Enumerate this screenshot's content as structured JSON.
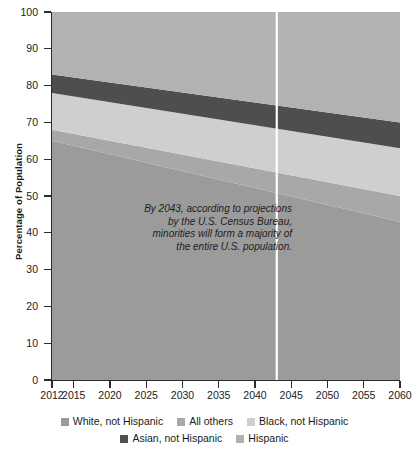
{
  "chart_data": {
    "type": "area",
    "title": "",
    "subtitle": "",
    "xlabel": "",
    "ylabel": "Percentage of Population",
    "xlim": [
      2012,
      2060
    ],
    "ylim": [
      0,
      100
    ],
    "grid": false,
    "stacked": true,
    "legend_position": "bottom",
    "x": [
      2012,
      2060
    ],
    "xticks": [
      "2012",
      "2015",
      "2020",
      "2025",
      "2030",
      "2035",
      "2040",
      "2045",
      "2050",
      "2055",
      "2060"
    ],
    "xtick_values": [
      2012,
      2015,
      2020,
      2025,
      2030,
      2035,
      2040,
      2045,
      2050,
      2055,
      2060
    ],
    "yticks": [
      "0",
      "10",
      "20",
      "30",
      "40",
      "50",
      "60",
      "70",
      "80",
      "90",
      "100"
    ],
    "ytick_values": [
      0,
      10,
      20,
      30,
      40,
      50,
      60,
      70,
      80,
      90,
      100
    ],
    "series": [
      {
        "name": "White, not Hispanic",
        "color": "#9b9b9b",
        "values": [
          65,
          43
        ],
        "cumulative_top": [
          65,
          43
        ]
      },
      {
        "name": "All others",
        "color": "#a8a8a8",
        "values": [
          3,
          7
        ],
        "cumulative_top": [
          68,
          50
        ]
      },
      {
        "name": "Black, not Hispanic",
        "color": "#cfcfcf",
        "values": [
          10,
          13
        ],
        "cumulative_top": [
          78,
          63
        ]
      },
      {
        "name": "Asian, not Hispanic",
        "color": "#4e4e4e",
        "values": [
          5,
          7
        ],
        "cumulative_top": [
          83,
          70
        ]
      },
      {
        "name": "Hispanic",
        "color": "#b2b2b2",
        "values": [
          17,
          30
        ],
        "cumulative_top": [
          100,
          100
        ]
      }
    ],
    "marker_line": {
      "x": 2043,
      "color": "#ffffff",
      "label": ""
    },
    "annotation": {
      "lines": [
        "By 2043, according to projections",
        "by the U.S. Census Bureau,",
        "minorities will form a majority of",
        "the entire U.S. population."
      ],
      "style": "italic"
    }
  },
  "axes": {
    "y_title": "Percentage of Population",
    "y_ticks": [
      {
        "value": 100,
        "label": "100"
      },
      {
        "value": 90,
        "label": "90"
      },
      {
        "value": 80,
        "label": "80"
      },
      {
        "value": 70,
        "label": "70"
      },
      {
        "value": 60,
        "label": "60"
      },
      {
        "value": 50,
        "label": "50"
      },
      {
        "value": 40,
        "label": "40"
      },
      {
        "value": 30,
        "label": "30"
      },
      {
        "value": 20,
        "label": "20"
      },
      {
        "value": 10,
        "label": "10"
      },
      {
        "value": 0,
        "label": "0"
      }
    ],
    "x_ticks": [
      {
        "value": 2012,
        "label": "2012"
      },
      {
        "value": 2015,
        "label": "2015"
      },
      {
        "value": 2020,
        "label": "2020"
      },
      {
        "value": 2025,
        "label": "2025"
      },
      {
        "value": 2030,
        "label": "2030"
      },
      {
        "value": 2035,
        "label": "2035"
      },
      {
        "value": 2040,
        "label": "2040"
      },
      {
        "value": 2045,
        "label": "2045"
      },
      {
        "value": 2050,
        "label": "2050"
      },
      {
        "value": 2055,
        "label": "2055"
      },
      {
        "value": 2060,
        "label": "2060"
      }
    ]
  },
  "annotation": {
    "line1": "By 2043, according to projections",
    "line2": "by the U.S. Census Bureau,",
    "line3": "minorities will form a majority of",
    "line4": "the entire U.S. population."
  },
  "legend": {
    "rows": [
      [
        {
          "label": "White, not Hispanic",
          "color": "#9b9b9b"
        },
        {
          "label": "All others",
          "color": "#a8a8a8"
        },
        {
          "label": "Black, not Hispanic",
          "color": "#cfcfcf"
        }
      ],
      [
        {
          "label": "Asian, not Hispanic",
          "color": "#4e4e4e"
        },
        {
          "label": "Hispanic",
          "color": "#b2b2b2"
        }
      ]
    ]
  },
  "colors": {
    "white_not_hispanic": "#9b9b9b",
    "all_others": "#a8a8a8",
    "black_not_hispanic": "#cfcfcf",
    "asian_not_hispanic": "#4e4e4e",
    "hispanic": "#b2b2b2",
    "marker_line": "#ffffff",
    "axis": "#2b2b2b",
    "text": "#1b1b1b",
    "background": "#ffffff"
  }
}
